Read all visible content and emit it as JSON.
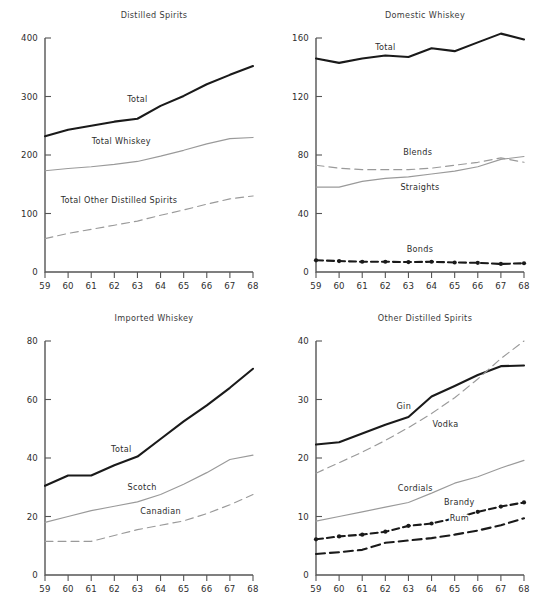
{
  "figure": {
    "name": "four-panel-liquor-consumption-line-charts",
    "background": "#ffffff",
    "colors": {
      "dark": "#1a1a1a",
      "gray": "#9a9a9a",
      "axis": "#555555",
      "text": "#2d2d2d"
    }
  },
  "chart_data": [
    {
      "id": "distilled-spirits",
      "type": "line",
      "title": "Distilled Spirits",
      "xlabel": "",
      "ylabel": "",
      "x": [
        59,
        60,
        61,
        62,
        63,
        64,
        65,
        66,
        67,
        68
      ],
      "xtick_labels": [
        "59",
        "60",
        "61",
        "62",
        "63",
        "64",
        "65",
        "66",
        "67",
        "68"
      ],
      "xlim": [
        59,
        68
      ],
      "ylim": [
        0,
        400
      ],
      "yticks": [
        0,
        100,
        200,
        300,
        400
      ],
      "ytick_labels": [
        "0",
        "100",
        "200",
        "300",
        "400"
      ],
      "grid": false,
      "legend": "inline-annotations",
      "series": [
        {
          "name": "Total",
          "style": "solid",
          "weight": "heavy",
          "color": "#1a1a1a",
          "markers": false,
          "label_x": 63.0,
          "label_y": 290,
          "values": [
            232,
            243,
            250,
            257,
            262,
            284,
            301,
            321,
            337,
            352
          ]
        },
        {
          "name": "Total Whiskey",
          "style": "solid",
          "weight": "light",
          "color": "#9a9a9a",
          "markers": false,
          "label_x": 62.3,
          "label_y": 218,
          "values": [
            173,
            177,
            180,
            184,
            189,
            198,
            208,
            219,
            228,
            230
          ]
        },
        {
          "name": "Total Other Distilled Spirits",
          "style": "dashed",
          "weight": "light",
          "color": "#9a9a9a",
          "markers": false,
          "label_x": 62.2,
          "label_y": 118,
          "values": [
            57,
            66,
            73,
            80,
            87,
            97,
            106,
            116,
            125,
            130
          ]
        }
      ]
    },
    {
      "id": "domestic-whiskey",
      "type": "line",
      "title": "Domestic Whiskey",
      "xlabel": "",
      "ylabel": "",
      "x": [
        59,
        60,
        61,
        62,
        63,
        64,
        65,
        66,
        67,
        68
      ],
      "xtick_labels": [
        "59",
        "60",
        "61",
        "62",
        "63",
        "64",
        "65",
        "66",
        "67",
        "68"
      ],
      "xlim": [
        59,
        68
      ],
      "ylim": [
        0,
        160
      ],
      "yticks": [
        0,
        40,
        80,
        120,
        160
      ],
      "ytick_labels": [
        "0",
        "40",
        "80",
        "120",
        "160"
      ],
      "grid": false,
      "legend": "inline-annotations",
      "series": [
        {
          "name": "Total",
          "style": "solid",
          "weight": "heavy",
          "color": "#1a1a1a",
          "markers": false,
          "label_x": 62.0,
          "label_y": 152,
          "values": [
            146,
            143,
            146,
            148,
            147,
            153,
            151,
            157,
            163,
            159
          ]
        },
        {
          "name": "Blends",
          "style": "dashed",
          "weight": "light",
          "color": "#9a9a9a",
          "markers": false,
          "label_x": 63.4,
          "label_y": 80,
          "values": [
            73,
            71,
            70,
            70,
            70,
            71,
            73,
            75,
            78,
            75
          ]
        },
        {
          "name": "Straights",
          "style": "solid",
          "weight": "light",
          "color": "#9a9a9a",
          "markers": false,
          "label_x": 63.5,
          "label_y": 56,
          "values": [
            58,
            58,
            62,
            64,
            65,
            67,
            69,
            72,
            77,
            79
          ]
        },
        {
          "name": "Bonds",
          "style": "dashdot",
          "weight": "heavy",
          "color": "#1a1a1a",
          "markers": true,
          "label_x": 63.5,
          "label_y": 14,
          "values": [
            8,
            7.5,
            7,
            7,
            6.8,
            7,
            6.5,
            6.3,
            5.5,
            6
          ]
        }
      ]
    },
    {
      "id": "imported-whiskey",
      "type": "line",
      "title": "Imported Whiskey",
      "xlabel": "",
      "ylabel": "",
      "x": [
        59,
        60,
        61,
        62,
        63,
        64,
        65,
        66,
        67,
        68
      ],
      "xtick_labels": [
        "59",
        "60",
        "61",
        "62",
        "63",
        "64",
        "65",
        "66",
        "67",
        "68"
      ],
      "xlim": [
        59,
        68
      ],
      "ylim": [
        0,
        80
      ],
      "yticks": [
        0,
        20,
        40,
        60,
        80
      ],
      "ytick_labels": [
        "0",
        "20",
        "40",
        "60",
        "80"
      ],
      "grid": false,
      "legend": "inline-annotations",
      "series": [
        {
          "name": "Total",
          "style": "solid",
          "weight": "heavy",
          "color": "#1a1a1a",
          "markers": false,
          "label_x": 62.3,
          "label_y": 42,
          "values": [
            30.5,
            34,
            34,
            37.5,
            40.5,
            46.5,
            52.5,
            58,
            64,
            70.5
          ]
        },
        {
          "name": "Scotch",
          "style": "solid",
          "weight": "light",
          "color": "#9a9a9a",
          "markers": false,
          "label_x": 63.2,
          "label_y": 29,
          "values": [
            18,
            20,
            22,
            23.5,
            25,
            27.5,
            31,
            35,
            39.5,
            41
          ]
        },
        {
          "name": "Canadian",
          "style": "dashed",
          "weight": "light",
          "color": "#9a9a9a",
          "markers": false,
          "label_x": 64.0,
          "label_y": 21,
          "values": [
            11.5,
            11.5,
            11.5,
            13.5,
            15.5,
            17,
            18.5,
            21,
            24,
            27.5
          ]
        }
      ]
    },
    {
      "id": "other-distilled-spirits",
      "type": "line",
      "title": "Other Distilled Spirits",
      "xlabel": "",
      "ylabel": "",
      "x": [
        59,
        60,
        61,
        62,
        63,
        64,
        65,
        66,
        67,
        68
      ],
      "xtick_labels": [
        "59",
        "60",
        "61",
        "62",
        "63",
        "64",
        "65",
        "66",
        "67",
        "68"
      ],
      "xlim": [
        59,
        68
      ],
      "ylim": [
        0,
        40
      ],
      "yticks": [
        0,
        10,
        20,
        30,
        40
      ],
      "ytick_labels": [
        "0",
        "10",
        "20",
        "30",
        "40"
      ],
      "grid": false,
      "legend": "inline-annotations",
      "series": [
        {
          "name": "Gin",
          "style": "solid",
          "weight": "heavy",
          "color": "#1a1a1a",
          "markers": false,
          "label_x": 62.8,
          "label_y": 28.3,
          "values": [
            22.3,
            22.7,
            24.2,
            25.7,
            27.0,
            30.5,
            32.3,
            34.2,
            35.7,
            35.8
          ]
        },
        {
          "name": "Vodka",
          "style": "dashed",
          "weight": "light",
          "color": "#9a9a9a",
          "markers": false,
          "label_x": 64.6,
          "label_y": 25.3,
          "values": [
            17.4,
            19.2,
            21.0,
            23.0,
            25.2,
            27.6,
            30.3,
            33.5,
            37.0,
            40.0
          ]
        },
        {
          "name": "Cordials",
          "style": "solid",
          "weight": "light",
          "color": "#9a9a9a",
          "markers": false,
          "label_x": 63.3,
          "label_y": 14.3,
          "values": [
            9.2,
            10.0,
            10.8,
            11.6,
            12.4,
            14.0,
            15.7,
            16.8,
            18.3,
            19.6
          ]
        },
        {
          "name": "Brandy",
          "style": "dashdot",
          "weight": "heavy",
          "color": "#1a1a1a",
          "markers": true,
          "label_x": 65.2,
          "label_y": 11.9,
          "values": [
            6.1,
            6.6,
            6.9,
            7.4,
            8.4,
            8.8,
            9.7,
            10.8,
            11.7,
            12.4
          ]
        },
        {
          "name": "Rum",
          "style": "dashed",
          "weight": "heavy",
          "color": "#1a1a1a",
          "markers": false,
          "label_x": 65.2,
          "label_y": 9.3,
          "values": [
            3.6,
            3.9,
            4.3,
            5.5,
            5.9,
            6.3,
            6.9,
            7.6,
            8.5,
            9.7
          ]
        }
      ]
    }
  ]
}
